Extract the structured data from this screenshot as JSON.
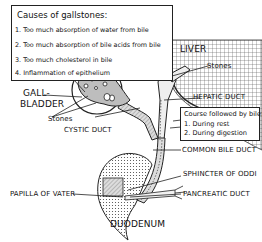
{
  "causes_box": {
    "title": "Causes of gallstones:",
    "items": [
      "1. Too much absorption of water from bile",
      "2. Too much absorption of bile acids from bile",
      "3. Too much cholesterol in bile",
      "4. Inflammation of epithelium"
    ]
  },
  "course_box": {
    "title": "Course followed by bile:",
    "items": [
      "1. During rest",
      "2. During digestion"
    ]
  },
  "labels": {
    "liver": "LIVER",
    "stones_liver": "Stones",
    "hepatic_duct": "HEPATIC DUCT",
    "gallbladder_line1": "GALL-",
    "gallbladder_line2": "BLADDER",
    "stones_gallbladder": "Stones",
    "cystic_duct": "CYSTIC DUCT",
    "common_bile_duct": "COMMON BILE DUCT",
    "sphincter_of_oddi": "SPHINCTER OF ODDI",
    "papilla_of_vater": "PAPILLA OF VATER",
    "pancreatic_duct": "PANCREATIC DUCT",
    "duodenum": "DUODENUM"
  }
}
